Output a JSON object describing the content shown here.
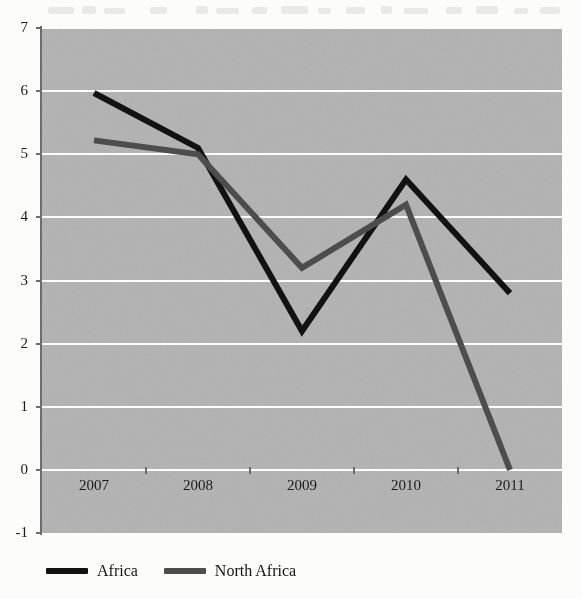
{
  "chart_data": {
    "type": "line",
    "title": "",
    "subtitle": "",
    "xlabel": "",
    "ylabel": "",
    "categories": [
      "2007",
      "2008",
      "2009",
      "2010",
      "2011"
    ],
    "series": [
      {
        "name": "Africa",
        "color": "#121212",
        "values": [
          5.97,
          5.1,
          2.2,
          4.6,
          2.8
        ]
      },
      {
        "name": "North Africa",
        "color": "#4d4d4d",
        "values": [
          5.22,
          5.0,
          3.2,
          4.2,
          0.0
        ]
      }
    ],
    "ylim": [
      -1,
      7
    ],
    "yticks": [
      -1,
      0,
      1,
      2,
      3,
      4,
      5,
      6,
      7
    ],
    "ytick_labels": [
      "-1",
      "0",
      "1",
      "2",
      "3",
      "4",
      "5",
      "6",
      "7"
    ],
    "grid": true,
    "gridlines_axis": "y",
    "grid_color": "#fdfdfd",
    "plot_background": "#b6b6b6",
    "legend_position": "bottom-left",
    "legend": [
      "Africa",
      "North Africa"
    ],
    "annotations": []
  },
  "legend_entries": [
    {
      "label": "Africa",
      "swatch_color": "#121212"
    },
    {
      "label": "North Africa",
      "swatch_color": "#4d4d4d"
    }
  ]
}
